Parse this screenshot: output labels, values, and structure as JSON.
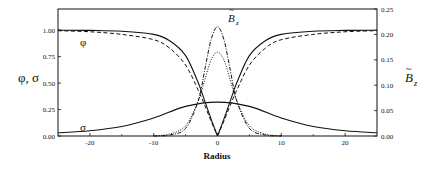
{
  "chart_data": {
    "type": "line",
    "title": "",
    "xlabel": "Radius",
    "ylabel": "φ, σ",
    "ylabel_right": "B̃z",
    "xlim": [
      -25,
      25
    ],
    "ylim": [
      0,
      1.2
    ],
    "ylim_right": [
      0,
      0.25
    ],
    "x_ticks": [
      -20,
      -10,
      0,
      10,
      20
    ],
    "x_tick_labels": [
      "-20",
      "-10",
      "0",
      "10",
      "20"
    ],
    "y_ticks": [
      0,
      0.25,
      0.5,
      0.75,
      1.0
    ],
    "y_tick_labels": [
      "0.00",
      "0.25",
      "0.50",
      "0.75",
      "1.00"
    ],
    "y_right_ticks": [
      0,
      0.05,
      0.1,
      0.15,
      0.2,
      0.25
    ],
    "y_right_tick_labels": [
      "0.00",
      "0.05",
      "0.10",
      "0.15",
      "0.20",
      "0.25"
    ],
    "grid": false,
    "legend": "none (curves labeled inline)",
    "annotations": [
      {
        "text": "φ",
        "x": -20.5,
        "y": 0.88
      },
      {
        "text": "σ",
        "x": -20.5,
        "y": 0.08
      },
      {
        "text": "B̃z",
        "x": 2.5,
        "y": 1.13
      }
    ],
    "series": [
      {
        "name": "φ (solid)",
        "axis": "left",
        "style": "solid",
        "x": [
          -25,
          -20,
          -15,
          -10,
          -7.5,
          -5,
          -3,
          -2,
          -1,
          0,
          1,
          2,
          3,
          5,
          7.5,
          10,
          15,
          20,
          25
        ],
        "values": [
          1.0,
          0.998,
          0.99,
          0.96,
          0.9,
          0.76,
          0.5,
          0.33,
          0.16,
          0.0,
          0.16,
          0.33,
          0.5,
          0.76,
          0.9,
          0.96,
          0.99,
          0.998,
          1.0
        ]
      },
      {
        "name": "φ (dashed)",
        "axis": "left",
        "style": "dashed",
        "x": [
          -25,
          -20,
          -15,
          -10,
          -7.5,
          -5,
          -3,
          -2,
          -1,
          0,
          1,
          2,
          3,
          5,
          7.5,
          10,
          15,
          20,
          25
        ],
        "values": [
          0.995,
          0.985,
          0.96,
          0.91,
          0.83,
          0.67,
          0.43,
          0.29,
          0.14,
          0.0,
          0.14,
          0.29,
          0.43,
          0.67,
          0.83,
          0.91,
          0.96,
          0.985,
          0.995
        ]
      },
      {
        "name": "σ",
        "axis": "left",
        "style": "solid",
        "x": [
          -25,
          -20,
          -15,
          -10,
          -5,
          0,
          5,
          10,
          15,
          20,
          25
        ],
        "values": [
          0.03,
          0.05,
          0.09,
          0.17,
          0.28,
          0.32,
          0.28,
          0.17,
          0.09,
          0.05,
          0.03
        ]
      },
      {
        "name": "B̃z (dash-dot)",
        "axis": "right",
        "style": "dashdot",
        "x": [
          -10,
          -7.5,
          -5,
          -3,
          -2,
          -1,
          0,
          1,
          2,
          3,
          5,
          7.5,
          10
        ],
        "values": [
          0.0,
          0.002,
          0.015,
          0.07,
          0.13,
          0.19,
          0.215,
          0.19,
          0.13,
          0.07,
          0.015,
          0.002,
          0.0
        ]
      },
      {
        "name": "B̃z (dotted)",
        "axis": "right",
        "style": "dotted",
        "x": [
          -10,
          -7.5,
          -5,
          -3,
          -2,
          -1,
          0,
          1,
          2,
          3,
          5,
          7.5,
          10
        ],
        "values": [
          0.0,
          0.004,
          0.02,
          0.07,
          0.11,
          0.15,
          0.165,
          0.15,
          0.11,
          0.07,
          0.02,
          0.004,
          0.0
        ]
      }
    ]
  },
  "labels": {
    "xlabel": "Radius",
    "ylabel_left": "φ, σ",
    "ylabel_right_base": "B",
    "ylabel_right_sub": "z",
    "phi": "φ",
    "sigma": "σ",
    "bz_base": "B",
    "bz_sub": "z"
  }
}
